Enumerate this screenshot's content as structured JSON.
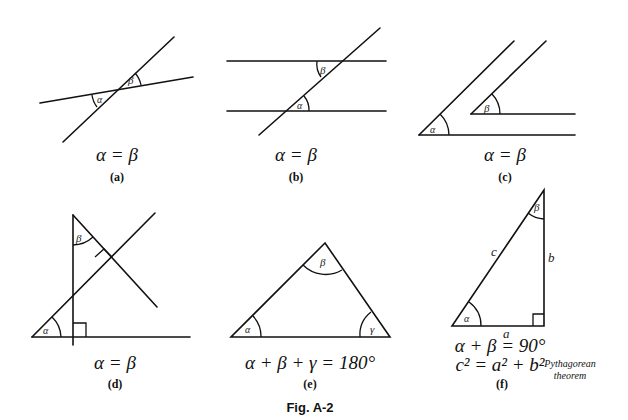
{
  "figure": {
    "caption": "Fig. A-2",
    "panels": [
      {
        "id": "a",
        "label": "(a)",
        "equation": "α = β",
        "angle_labels": [
          "α",
          "β"
        ],
        "description": "Vertical angles formed by two intersecting lines"
      },
      {
        "id": "b",
        "label": "(b)",
        "equation": "α = β",
        "angle_labels": [
          "α",
          "β"
        ],
        "description": "Alternate angles formed by a transversal crossing two parallel lines"
      },
      {
        "id": "c",
        "label": "(c)",
        "equation": "α = β",
        "angle_labels": [
          "α",
          "β"
        ],
        "description": "Angles with parallel sides"
      },
      {
        "id": "d",
        "label": "(d)",
        "equation": "α = β",
        "angle_labels": [
          "α",
          "β"
        ],
        "description": "Angles with mutually perpendicular sides"
      },
      {
        "id": "e",
        "label": "(e)",
        "equation": "α + β + γ = 180°",
        "angle_labels": [
          "α",
          "β",
          "γ"
        ],
        "description": "Sum of interior angles of a triangle"
      },
      {
        "id": "f",
        "label": "(f)",
        "equation": "α + β = 90°",
        "equation2": "c² = a² + b²",
        "note_line1": "Pythagorean",
        "note_line2": "theorem",
        "angle_labels": [
          "α",
          "β"
        ],
        "side_labels": [
          "a",
          "b",
          "c"
        ],
        "description": "Right triangle"
      }
    ]
  }
}
